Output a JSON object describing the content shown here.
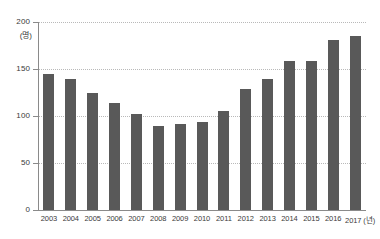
{
  "chart_data": {
    "type": "bar",
    "title": "",
    "xlabel": "(년)",
    "ylabel": "(명)",
    "unit_label": "(명)",
    "x_axis_suffix": "(년)",
    "categories": [
      "2003",
      "2004",
      "2005",
      "2006",
      "2007",
      "2008",
      "2009",
      "2010",
      "2011",
      "2012",
      "2013",
      "2014",
      "2015",
      "2016",
      "2017"
    ],
    "values": [
      145,
      139,
      124,
      114,
      102,
      89,
      91,
      94,
      105,
      129,
      139,
      158,
      159,
      181,
      185
    ],
    "ylim": [
      0,
      200
    ],
    "yticks": [
      0,
      50,
      100,
      150,
      200
    ],
    "ytick_labels": [
      "0",
      "50",
      "100",
      "150",
      "200"
    ],
    "grid": true,
    "grid_style": "dotted",
    "legend": "none",
    "series": [
      {
        "name": "",
        "values": [
          145,
          139,
          124,
          114,
          102,
          89,
          91,
          94,
          105,
          129,
          139,
          158,
          159,
          181,
          185
        ]
      }
    ],
    "colors": {
      "bar": "#595959",
      "axis": "#8a8a8a",
      "grid": "#b9b9b9",
      "text": "#3a3a3a",
      "background": "#ffffff"
    }
  }
}
